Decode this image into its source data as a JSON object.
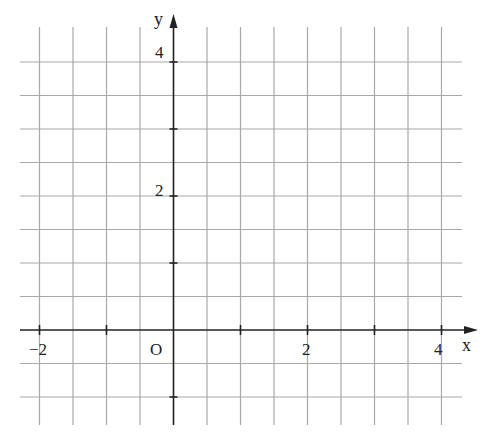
{
  "diagram": {
    "type": "coordinate_grid",
    "x_axis_label": "x",
    "y_axis_label": "y",
    "origin_label": "O",
    "x_tick_labels": [
      {
        "value": -2,
        "text": "−2"
      },
      {
        "value": 2,
        "text": "2"
      },
      {
        "value": 4,
        "text": "4"
      }
    ],
    "y_tick_labels": [
      {
        "value": 2,
        "text": "2"
      },
      {
        "value": 4,
        "text": "4"
      }
    ],
    "x_range": [
      -2.4,
      4.3
    ],
    "y_range": [
      -1.4,
      4.5
    ],
    "grid_spacing": 0.5,
    "tick_spacing": 1,
    "colors": {
      "grid": "#a8a8a8",
      "axis": "#222222",
      "background": "#ffffff"
    }
  }
}
